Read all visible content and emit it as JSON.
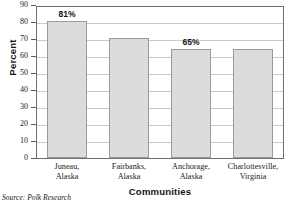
{
  "chart_data": {
    "type": "bar",
    "title": "",
    "categories": [
      "Juneau, Alaska",
      "Fairbanks, Alaska",
      "Anchorage, Alaska",
      "Charlottesville, Virginia"
    ],
    "category_lines": [
      [
        "Juneau,",
        "Alaska"
      ],
      [
        "Fairbanks,",
        "Alaska"
      ],
      [
        "Anchorage,",
        "Alaska"
      ],
      [
        "Charlottesville,",
        "Virginia"
      ]
    ],
    "values": [
      81,
      71,
      65,
      64.5
    ],
    "data_labels": [
      "81%",
      "",
      "65%",
      ""
    ],
    "xlabel": "Communities",
    "ylabel": "Percent",
    "ylim": [
      0,
      90
    ],
    "ytick_step": 10,
    "yticks": [
      0,
      10,
      20,
      30,
      40,
      50,
      60,
      70,
      80,
      90
    ],
    "ytick_labels": [
      "0",
      "10",
      "20",
      "30",
      "40",
      "50",
      "60",
      "70",
      "80",
      "90"
    ],
    "grid": true,
    "legend": false,
    "bar_color": "#dcdcdc",
    "bar_border_color": "#9a9a9a",
    "grid_color": "#c9c9c9",
    "frame_color": "#6f6f6f"
  },
  "source": {
    "text": "Source: Polk Research"
  }
}
